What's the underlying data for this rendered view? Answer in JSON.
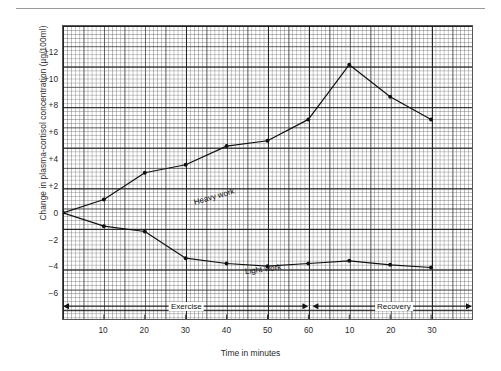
{
  "chart_data": {
    "type": "line",
    "title": "",
    "xlabel": "Time in minutes",
    "ylabel": "Change in plasma-cortisol concentration (µg/100ml)",
    "ylim": [
      -8,
      14
    ],
    "xlim": [
      0,
      100
    ],
    "grid": true,
    "grid_style": "fine graph paper, 1/5/10 unit rulings",
    "legend": "inline labels on curves",
    "ytick_labels": [
      "+12",
      "+10",
      "+8",
      "+6",
      "+4",
      "+2",
      "0",
      "−2",
      "−4",
      "−6"
    ],
    "ytick_values": [
      12,
      10,
      8,
      6,
      4,
      2,
      0,
      -2,
      -4,
      -6
    ],
    "xtick_labels": [
      "10",
      "20",
      "30",
      "40",
      "50",
      "60",
      "10",
      "20",
      "30"
    ],
    "xtick_values": [
      10,
      20,
      30,
      40,
      50,
      60,
      70,
      80,
      90
    ],
    "series": [
      {
        "name": "Heavy work",
        "label_text": "Heavy work",
        "marker": "filled-circle",
        "color": "#111111",
        "x": [
          0,
          10,
          20,
          30,
          40,
          50,
          60,
          70,
          80,
          90
        ],
        "values": [
          0,
          1.0,
          3.0,
          3.6,
          5.0,
          5.4,
          7.0,
          11.1,
          8.7,
          7.0
        ]
      },
      {
        "name": "Light work",
        "label_text": "Light work",
        "marker": "filled-circle",
        "color": "#111111",
        "x": [
          0,
          10,
          20,
          30,
          40,
          50,
          60,
          70,
          80,
          90
        ],
        "values": [
          0,
          -1.0,
          -1.4,
          -3.4,
          -3.8,
          -4.0,
          -3.8,
          -3.6,
          -3.9,
          -4.1
        ]
      }
    ],
    "annotations": [
      {
        "name": "exercise-span",
        "text": "Exercise",
        "from": 0,
        "to": 60,
        "y": -7.0,
        "style": "double-headed-arrow"
      },
      {
        "name": "recovery-span",
        "text": "Recovery",
        "from": 61,
        "to": 100,
        "y": -7.0,
        "style": "double-headed-arrow"
      }
    ]
  },
  "axis": {
    "ylabel": "Change in plasma-cortisol concentration (µg/100ml)",
    "xlabel": "Time in minutes"
  },
  "colors": {
    "line": "#111111",
    "grid_fine": "#808080",
    "grid_bold": "#191919",
    "frame": "#555555",
    "text": "#2a2a2a",
    "background": "#ffffff"
  }
}
